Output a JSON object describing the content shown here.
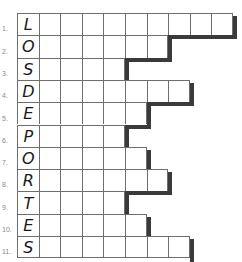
{
  "puzzle": {
    "vertical_word": "LOSDEPORTES",
    "rows": [
      {
        "number": "1.",
        "letter": "L",
        "cells": 10
      },
      {
        "number": "2.",
        "letter": "O",
        "cells": 7
      },
      {
        "number": "3.",
        "letter": "S",
        "cells": 5
      },
      {
        "number": "4.",
        "letter": "D",
        "cells": 8
      },
      {
        "number": "5.",
        "letter": "E",
        "cells": 6
      },
      {
        "number": "6.",
        "letter": "P",
        "cells": 5
      },
      {
        "number": "7.",
        "letter": "O",
        "cells": 6
      },
      {
        "number": "8.",
        "letter": "R",
        "cells": 7
      },
      {
        "number": "9.",
        "letter": "T",
        "cells": 5
      },
      {
        "number": "10.",
        "letter": "E",
        "cells": 6
      },
      {
        "number": "11.",
        "letter": "S",
        "cells": 8
      }
    ]
  },
  "colors": {
    "grid_line": "#6e6e6e",
    "shadow": "#3a3a3a",
    "letter": "#1a1a1a",
    "number": "#8a8a8a"
  }
}
